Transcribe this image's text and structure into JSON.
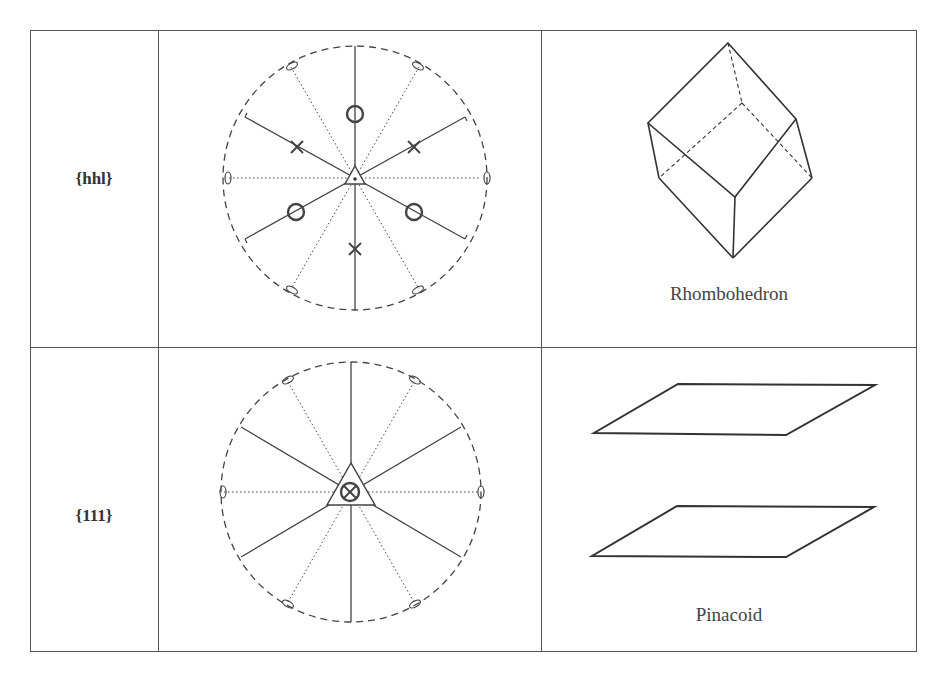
{
  "table": {
    "columns": [
      "form",
      "stereogram",
      "crystal_form"
    ],
    "rows": [
      {
        "form_index": "{hhl}",
        "stereogram": {
          "center_symbol": "triangle-with-dot",
          "poles_upper": "x",
          "poles_lower": "o",
          "pole_count_upper": 3,
          "pole_count_lower": 3
        },
        "form_name": "Rhombohedron"
      },
      {
        "form_index": "{111}",
        "stereogram": {
          "center_symbol": "triangle-with-circled-x",
          "pole_count": 2
        },
        "form_name": "Pinacoid"
      }
    ]
  },
  "colors": {
    "line": "#444444",
    "background": "#ffffff"
  }
}
